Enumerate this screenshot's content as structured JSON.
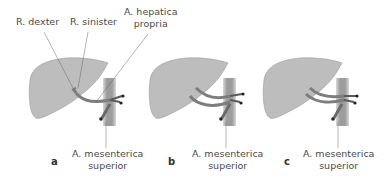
{
  "labels": {
    "r_dexter": "R. dexter",
    "r_sinister": "R. sinister",
    "hepatica_line1": "A. hepatica",
    "hepatica_line2": "propria",
    "sma_line1": "A. mesenterica",
    "sma_line2": "superior"
  },
  "panels": [
    {
      "letter": "a"
    },
    {
      "letter": "b"
    },
    {
      "letter": "c"
    }
  ],
  "colors": {
    "liver_fill": "#bdbdbd",
    "liver_stroke": "#8a8a8a",
    "vessel": "#7d7d7d",
    "aorta": "#a6a6a6",
    "leader": "#6b6b6b"
  }
}
